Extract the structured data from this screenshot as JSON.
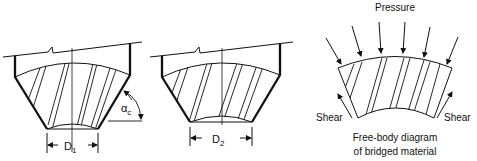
{
  "diagram": {
    "hopper_1": {
      "dimension_label": "D",
      "dimension_subscript": "1",
      "angle_label": "α",
      "angle_subscript": "c"
    },
    "hopper_2": {
      "dimension_label": "D",
      "dimension_subscript": "2"
    },
    "free_body": {
      "load_label": "Pressure",
      "left_force_label": "Shear",
      "right_force_label": "Shear",
      "caption_line1": "Free-body diagram",
      "caption_line2": "of bridged material"
    }
  },
  "colors": {
    "ink": "#111111",
    "background": "#ffffff"
  }
}
